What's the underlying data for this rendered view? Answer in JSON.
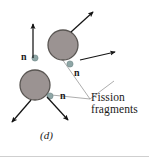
{
  "figure": {
    "panel_label": "(d)",
    "caption_label": {
      "line1": "Fission",
      "line2": "fragments"
    },
    "neutron_labels": [
      {
        "id": "n-upper-left",
        "text": "n",
        "x": 22,
        "y": 54,
        "dot_x": 35,
        "dot_y": 58
      },
      {
        "id": "n-middle-right",
        "text": "n",
        "x": 74,
        "y": 70,
        "dot_x": 70,
        "dot_y": 64
      },
      {
        "id": "n-lower",
        "text": "n",
        "x": 60,
        "y": 95,
        "dot_x": 50,
        "dot_y": 96
      }
    ],
    "fragments": [
      {
        "id": "fragment-upper-right",
        "cx": 63,
        "cy": 45,
        "r": 15
      },
      {
        "id": "fragment-lower-left",
        "cx": 35,
        "cy": 85,
        "r": 15
      }
    ],
    "arrows": [
      {
        "id": "arrow-up",
        "x1": 33,
        "y1": 58,
        "x2": 33,
        "y2": 23
      },
      {
        "id": "arrow-upper-right",
        "x1": 71,
        "y1": 32,
        "x2": 94,
        "y2": 11
      },
      {
        "id": "arrow-right",
        "x1": 80,
        "y1": 60,
        "x2": 116,
        "y2": 51
      },
      {
        "id": "arrow-lower-left",
        "x1": 31,
        "y1": 100,
        "x2": 11,
        "y2": 123
      },
      {
        "id": "arrow-lower-right",
        "x1": 47,
        "y1": 97,
        "x2": 69,
        "y2": 121
      }
    ],
    "leader_lines": [
      {
        "id": "leader-to-upper-fragment",
        "x1": 90,
        "y1": 99,
        "x2": 62,
        "y2": 59
      },
      {
        "id": "leader-to-lower-fragment",
        "x1": 90,
        "y1": 99,
        "x2": 42,
        "y2": 94
      },
      {
        "id": "leader-to-label-top",
        "x1": 90,
        "y1": 99,
        "x2": 113,
        "y2": 82
      }
    ],
    "colors": {
      "fragment_fill": "#9b9392",
      "fragment_stroke": "#595552",
      "neutron_dot": "#8fa6a6",
      "neutron_dot_stroke": "#6f8787",
      "arrow": "#141414",
      "leader_line": "#8a8a8a",
      "text": "#1a1a1a",
      "background": "#ffffff",
      "bottom_rule": "#cfcfcf"
    }
  }
}
